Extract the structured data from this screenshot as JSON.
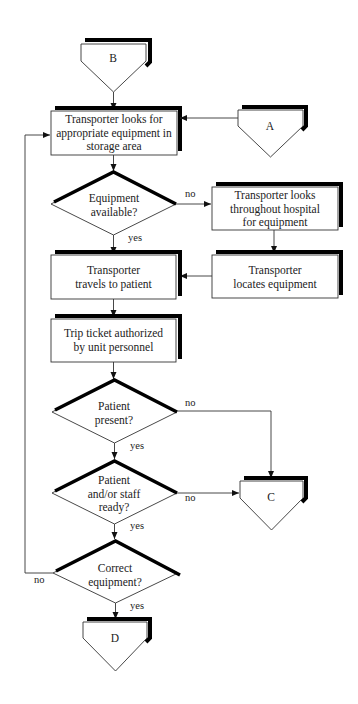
{
  "diagram": {
    "type": "flowchart",
    "connectors": {
      "b": "B",
      "a": "A",
      "c": "C",
      "d": "D"
    },
    "processes": {
      "look_storage": "Transporter looks for\nappropriate equipment in\nstorage area",
      "look_hospital": "Transporter looks\nthroughout hospital\nfor equipment",
      "locates": "Transporter\nlocates equipment",
      "travels": "Transporter\ntravels to patient",
      "trip_ticket": "Trip ticket authorized\nby unit personnel"
    },
    "decisions": {
      "available": "Equipment\navailable?",
      "present": "Patient\npresent?",
      "ready": "Patient\nand/or staff\nready?",
      "correct": "Correct\nequipment?"
    },
    "edge_labels": {
      "available_no": "no",
      "available_yes": "yes",
      "present_no": "no",
      "present_yes": "yes",
      "ready_no": "no",
      "ready_yes": "yes",
      "correct_no": "no",
      "correct_yes": "yes"
    }
  }
}
